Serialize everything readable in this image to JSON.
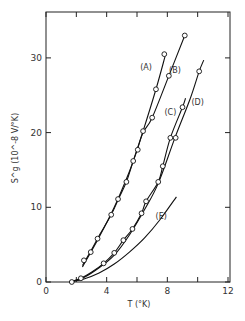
{
  "chart_data": {
    "type": "line",
    "title": "",
    "xlabel": "T (°K)",
    "ylabel": "S^g (10^-8 V/°K)",
    "xlim": [
      0,
      12
    ],
    "ylim": [
      0,
      35
    ],
    "x_ticks": [
      0,
      2,
      4,
      6,
      8,
      10,
      12
    ],
    "x_tick_labels": [
      "0",
      "4",
      "8",
      "12"
    ],
    "x_tick_label_values": [
      0,
      4,
      8,
      12
    ],
    "y_ticks": [
      0,
      10,
      20,
      30
    ],
    "y_tick_labels": [
      "0",
      "10",
      "20",
      "30"
    ],
    "grid": false,
    "legend": "inline curve labels",
    "series": [
      {
        "name": "(A)",
        "label_pos": [
          6.6,
          28.4
        ],
        "curve": [
          [
            2.4,
            2.2
          ],
          [
            3.0,
            4.3
          ],
          [
            3.5,
            6.2
          ],
          [
            4.3,
            9.0
          ],
          [
            4.8,
            11.2
          ],
          [
            5.3,
            13.4
          ],
          [
            5.75,
            16.2
          ],
          [
            6.4,
            20.2
          ],
          [
            7.25,
            25.8
          ],
          [
            7.85,
            30.2
          ]
        ],
        "points": [
          [
            2.5,
            2.9
          ],
          [
            2.95,
            4.0
          ],
          [
            3.4,
            5.8
          ],
          [
            4.3,
            9.0
          ],
          [
            4.75,
            11.1
          ],
          [
            5.3,
            13.4
          ],
          [
            5.75,
            16.2
          ],
          [
            6.4,
            20.2
          ],
          [
            7.25,
            25.8
          ],
          [
            7.8,
            30.5
          ]
        ]
      },
      {
        "name": "(B)",
        "label_pos": [
          8.5,
          28.0
        ],
        "curve": [
          [
            2.4,
            2.0
          ],
          [
            3.5,
            6.0
          ],
          [
            4.5,
            10.0
          ],
          [
            5.5,
            14.8
          ],
          [
            6.0,
            17.6
          ],
          [
            6.4,
            20.0
          ],
          [
            7.0,
            22.0
          ],
          [
            8.1,
            27.6
          ],
          [
            9.15,
            33.0
          ]
        ],
        "points": [
          [
            6.05,
            17.7
          ],
          [
            7.0,
            22.0
          ],
          [
            8.1,
            27.6
          ],
          [
            9.15,
            33.0
          ]
        ]
      },
      {
        "name": "(C)",
        "label_pos": [
          8.2,
          22.4
        ],
        "curve": [
          [
            1.6,
            0.0
          ],
          [
            2.3,
            0.5
          ],
          [
            3.0,
            1.3
          ],
          [
            3.8,
            2.5
          ],
          [
            4.5,
            3.9
          ],
          [
            5.1,
            5.6
          ],
          [
            5.7,
            7.1
          ],
          [
            6.3,
            9.2
          ],
          [
            6.6,
            10.8
          ],
          [
            7.4,
            13.4
          ],
          [
            7.7,
            15.5
          ],
          [
            8.2,
            19.3
          ],
          [
            9.0,
            23.4
          ],
          [
            9.2,
            24.6
          ]
        ],
        "points": [
          [
            1.7,
            0.0
          ],
          [
            2.3,
            0.5
          ],
          [
            3.8,
            2.5
          ],
          [
            4.5,
            3.9
          ],
          [
            5.1,
            5.6
          ],
          [
            5.7,
            7.1
          ],
          [
            6.3,
            9.2
          ],
          [
            6.6,
            10.8
          ],
          [
            7.4,
            13.4
          ],
          [
            7.7,
            15.5
          ],
          [
            8.2,
            19.3
          ],
          [
            9.0,
            23.4
          ]
        ]
      },
      {
        "name": "(D)",
        "label_pos": [
          10.0,
          23.7
        ],
        "curve": [
          [
            1.6,
            0.0
          ],
          [
            2.5,
            0.6
          ],
          [
            3.5,
            1.9
          ],
          [
            4.5,
            3.6
          ],
          [
            5.5,
            6.3
          ],
          [
            6.5,
            9.7
          ],
          [
            7.4,
            13.2
          ],
          [
            8.5,
            19.3
          ],
          [
            9.5,
            24.5
          ],
          [
            10.1,
            28.2
          ],
          [
            10.4,
            29.7
          ]
        ],
        "points": [
          [
            8.55,
            19.3
          ],
          [
            10.1,
            28.2
          ]
        ]
      },
      {
        "name": "(E)",
        "label_pos": [
          7.6,
          8.4
        ],
        "curve": [
          [
            1.6,
            0.0
          ],
          [
            2.5,
            0.4
          ],
          [
            3.5,
            1.2
          ],
          [
            4.5,
            2.4
          ],
          [
            5.5,
            4.0
          ],
          [
            6.5,
            5.9
          ],
          [
            7.5,
            8.3
          ],
          [
            8.6,
            11.4
          ]
        ],
        "points": []
      }
    ]
  }
}
